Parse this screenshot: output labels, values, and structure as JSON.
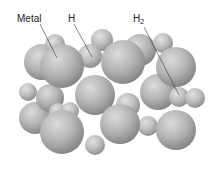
{
  "diagram": {
    "labels": [
      {
        "id": "metal",
        "text": "Metal",
        "x": 17,
        "y": 14
      },
      {
        "id": "h",
        "text": "H",
        "x": 68,
        "y": 14
      },
      {
        "id": "h2",
        "text": "H",
        "sub": "2",
        "x": 133,
        "y": 14
      }
    ],
    "colors": {
      "sphere_light": "#d4d4d4",
      "sphere_mid": "#a8a8a8",
      "sphere_dark": "#7a7a7a",
      "leader_line": "#333333",
      "text": "#222222"
    }
  }
}
